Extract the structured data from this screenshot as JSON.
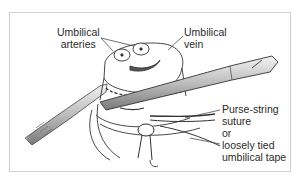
{
  "figure": {
    "labels": {
      "arteries": [
        "Umbilical",
        "arteries"
      ],
      "vein": [
        "Umbilical",
        "vein"
      ],
      "suture": [
        "Purse-string",
        "suture",
        "or",
        "loosely tied",
        "umbilical tape"
      ]
    },
    "colors": {
      "frame_border": "#cfcfcf",
      "line": "#333333",
      "instrument_fill": "#d9d9d9",
      "text": "#2a2a2a"
    }
  }
}
